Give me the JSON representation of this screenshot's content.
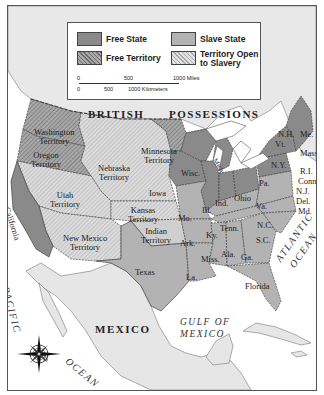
{
  "legend": {
    "items": [
      {
        "label": "Free State",
        "pattern": "solid",
        "color": "#8a8a8a"
      },
      {
        "label": "Slave State",
        "pattern": "solid",
        "color": "#b3b3b3"
      },
      {
        "label": "Free Territory",
        "pattern": "hatched",
        "color": "#9a9a9a"
      },
      {
        "label": "Territory Open to Slavery",
        "line1": "Territory Open",
        "line2": "to Slavery",
        "pattern": "hatched",
        "color": "#d0d0d0"
      }
    ],
    "scale": {
      "miles": [
        "0",
        "500",
        "1000 Miles"
      ],
      "kilometers": [
        "0",
        "500",
        "1000 Kilometers"
      ]
    }
  },
  "regions": {
    "british_line1": "BRITISH",
    "british_line2": "POSSESSIONS",
    "mexico": "MEXICO",
    "gulf_line1": "GULF OF",
    "gulf_line2": "MEXICO",
    "pacific": "PACIFIC",
    "ocean_pacific": "OCEAN",
    "atlantic": "ATLANTIC",
    "ocean_atlantic": "OCEAN"
  },
  "territories": {
    "washington": [
      "Washington",
      "Territory"
    ],
    "oregon": [
      "Oregon",
      "Territory"
    ],
    "minnesota": [
      "Minnesota",
      "Territory"
    ],
    "nebraska": [
      "Nebraska",
      "Territory"
    ],
    "utah": [
      "Utah",
      "Territory"
    ],
    "kansas": [
      "Kansas",
      "Territory"
    ],
    "new_mexico": [
      "New Mexico",
      "Territory"
    ],
    "indian": [
      "Indian",
      "Territory"
    ]
  },
  "states": {
    "california": "California",
    "texas": "Texas",
    "iowa": "Iowa",
    "wisc": "Wisc.",
    "mich": "Mich.",
    "ill": "Ill.",
    "ind": "Ind.",
    "ohio": "Ohio",
    "mo": "Mo.",
    "ky": "Ky.",
    "ark": "Ark.",
    "tenn": "Tenn.",
    "miss": "Miss.",
    "ala": "Ala.",
    "ga": "Ga.",
    "la": "La.",
    "florida": "Florida",
    "nc": "N.C.",
    "sc": "S.C.",
    "va": "Va.",
    "pa": "Pa.",
    "ny": "N.Y.",
    "vt": "Vt.",
    "nh": "N.H.",
    "me": "Me.",
    "mass": "Mass.",
    "ri": "R.I.",
    "conn": "Conn.",
    "nj": "N.J.",
    "del": "Del.",
    "md": "Md."
  },
  "compass": {
    "north": "N"
  },
  "colors": {
    "free_state": "#8a8a8a",
    "slave_state": "#b3b3b3",
    "free_territory": "#9a9a9a",
    "open_territory": "#d2d2d2",
    "water": "#ffffff",
    "foreign_land": "#e6e6e6"
  }
}
